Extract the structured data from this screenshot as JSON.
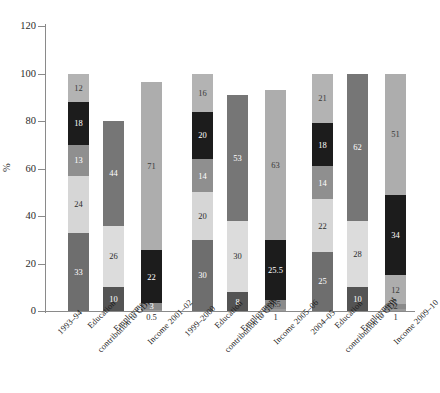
{
  "chart_data": {
    "type": "bar",
    "subtype": "stacked-bar",
    "title": "",
    "xlabel": "",
    "ylabel": "%",
    "ylim": [
      0,
      120
    ],
    "yticks": [
      0,
      20,
      40,
      60,
      80,
      100,
      120
    ],
    "grid": false,
    "legend": "none",
    "categories": [
      "1993–94",
      "Education",
      "Employment",
      "contribution to GDP",
      "Income 2001–02",
      "1999–2000",
      "Education",
      "Employment",
      "contribution to GDP",
      "Income 2005–06",
      "2004–05",
      "Education",
      "Employment",
      "contribution to GDP",
      "Income 2009–10"
    ],
    "bars": [
      {
        "name": "bar-1",
        "group": "1993-94",
        "total": 100,
        "segments": [
          {
            "value": 33,
            "label": "33",
            "color": "#6e6e6e",
            "text_color": "#ffffff"
          },
          {
            "value": 24,
            "label": "24",
            "color": "#d6d6d6",
            "text_color": "#2b2b2b"
          },
          {
            "value": 13,
            "label": "13",
            "color": "#8f8f8f",
            "text_color": "#ffffff"
          },
          {
            "value": 18,
            "label": "18",
            "color": "#1c1c1c",
            "text_color": "#ffffff"
          },
          {
            "value": 12,
            "label": "12",
            "color": "#b3b3b3",
            "text_color": "#3a3a3a"
          }
        ]
      },
      {
        "name": "bar-2",
        "group": "1993-94",
        "total": 80,
        "segments": [
          {
            "value": 10,
            "label": "10",
            "color": "#545454",
            "text_color": "#ffffff"
          },
          {
            "value": 26,
            "label": "26",
            "color": "#dcdcdc",
            "text_color": "#2b2b2b"
          },
          {
            "value": 44,
            "label": "44",
            "color": "#767676",
            "text_color": "#ffffff"
          }
        ]
      },
      {
        "name": "bar-3",
        "group": "1993-94",
        "total": 100,
        "segments": [
          {
            "value": 0.5,
            "label": "0.5",
            "color": "#9a9a9a",
            "text_color": "#2b2b2b",
            "label_position": "below"
          },
          {
            "value": 3,
            "label": "3",
            "color": "#8a8a8a",
            "text_color": "#ffffff"
          },
          {
            "value": 22,
            "label": "22",
            "color": "#1c1c1c",
            "text_color": "#ffffff"
          },
          {
            "value": 71,
            "label": "71",
            "color": "#adadad",
            "text_color": "#3a3a3a"
          }
        ]
      },
      {
        "name": "bar-4",
        "group": "1999-2000",
        "total": 100,
        "segments": [
          {
            "value": 30,
            "label": "30",
            "color": "#6e6e6e",
            "text_color": "#ffffff"
          },
          {
            "value": 20,
            "label": "20",
            "color": "#d6d6d6",
            "text_color": "#2b2b2b"
          },
          {
            "value": 14,
            "label": "14",
            "color": "#8f8f8f",
            "text_color": "#ffffff"
          },
          {
            "value": 20,
            "label": "20",
            "color": "#1c1c1c",
            "text_color": "#ffffff"
          },
          {
            "value": 16,
            "label": "16",
            "color": "#b3b3b3",
            "text_color": "#3a3a3a"
          }
        ]
      },
      {
        "name": "bar-5",
        "group": "1999-2000",
        "total": 91,
        "segments": [
          {
            "value": 8,
            "label": "8",
            "color": "#545454",
            "text_color": "#ffffff"
          },
          {
            "value": 30,
            "label": "30",
            "color": "#dcdcdc",
            "text_color": "#2b2b2b"
          },
          {
            "value": 53,
            "label": "53",
            "color": "#767676",
            "text_color": "#ffffff"
          }
        ]
      },
      {
        "name": "bar-6",
        "group": "1999-2000",
        "total": 93,
        "segments": [
          {
            "value": 1,
            "label": "1",
            "color": "#9a9a9a",
            "text_color": "#2b2b2b",
            "label_position": "below"
          },
          {
            "value": 3.5,
            "label": "0.5",
            "color": "#8a8a8a",
            "text_color": "#3a3a3a"
          },
          {
            "value": 25.5,
            "label": "25.5",
            "color": "#1c1c1c",
            "text_color": "#ffffff"
          },
          {
            "value": 63,
            "label": "63",
            "color": "#adadad",
            "text_color": "#3a3a3a"
          }
        ]
      },
      {
        "name": "bar-7",
        "group": "2004-05",
        "total": 100,
        "segments": [
          {
            "value": 25,
            "label": "25",
            "color": "#6e6e6e",
            "text_color": "#ffffff"
          },
          {
            "value": 22,
            "label": "22",
            "color": "#d6d6d6",
            "text_color": "#2b2b2b"
          },
          {
            "value": 14,
            "label": "14",
            "color": "#8f8f8f",
            "text_color": "#ffffff"
          },
          {
            "value": 18,
            "label": "18",
            "color": "#1c1c1c",
            "text_color": "#ffffff"
          },
          {
            "value": 21,
            "label": "21",
            "color": "#b3b3b3",
            "text_color": "#3a3a3a"
          }
        ]
      },
      {
        "name": "bar-8",
        "group": "2004-05",
        "total": 100,
        "segments": [
          {
            "value": 10,
            "label": "10",
            "color": "#545454",
            "text_color": "#ffffff"
          },
          {
            "value": 28,
            "label": "28",
            "color": "#dcdcdc",
            "text_color": "#2b2b2b"
          },
          {
            "value": 62,
            "label": "62",
            "color": "#767676",
            "text_color": "#ffffff"
          }
        ]
      },
      {
        "name": "bar-9",
        "group": "2004-05",
        "total": 100,
        "segments": [
          {
            "value": 1,
            "label": "1",
            "color": "#9a9a9a",
            "text_color": "#2b2b2b",
            "label_position": "below"
          },
          {
            "value": 2,
            "label": "2",
            "color": "#8a8a8a",
            "text_color": "#3a3a3a"
          },
          {
            "value": 12,
            "label": "12",
            "color": "#adadad",
            "text_color": "#3a3a3a"
          },
          {
            "value": 34,
            "label": "34",
            "color": "#1c1c1c",
            "text_color": "#ffffff"
          },
          {
            "value": 51,
            "label": "51",
            "color": "#adadad",
            "text_color": "#3a3a3a"
          }
        ]
      }
    ]
  },
  "axis": {
    "y_title": "%",
    "y_tick_labels": [
      "0",
      "20",
      "40",
      "60",
      "80",
      "100",
      "120"
    ]
  },
  "x_labels": [
    {
      "text": "1993–94",
      "x": 56,
      "y": 330
    },
    {
      "text": "Education",
      "x": 86,
      "y": 324
    },
    {
      "text": "Employment",
      "x": 112,
      "y": 327
    },
    {
      "text": "contribution to GDP",
      "x": 96,
      "y": 348
    },
    {
      "text": "Income 2001–02",
      "x": 146,
      "y": 340
    },
    {
      "text": "1999–2000",
      "x": 183,
      "y": 332
    },
    {
      "text": "Education",
      "x": 213,
      "y": 324
    },
    {
      "text": "Employment",
      "x": 239,
      "y": 327
    },
    {
      "text": "contribution to GDP",
      "x": 223,
      "y": 348
    },
    {
      "text": "Income 2005–06",
      "x": 272,
      "y": 340
    },
    {
      "text": "2004–05",
      "x": 309,
      "y": 330
    },
    {
      "text": "Education",
      "x": 333,
      "y": 324
    },
    {
      "text": "Employment",
      "x": 359,
      "y": 327
    },
    {
      "text": "contribution to GDP",
      "x": 343,
      "y": 348
    },
    {
      "text": "Income 2009–10",
      "x": 392,
      "y": 340
    }
  ],
  "bar_x_positions": [
    68,
    103,
    141,
    192,
    227,
    265,
    312,
    347,
    385
  ]
}
